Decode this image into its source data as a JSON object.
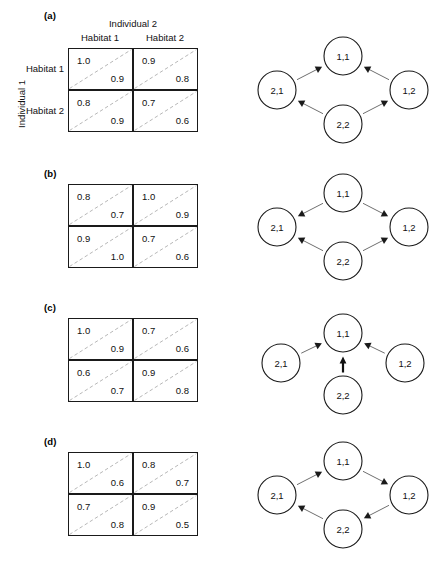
{
  "figure": {
    "axis_top_title": "Individual 2",
    "axis_left_title": "Individual 1",
    "col_headers": [
      "Habitat 1",
      "Habitat 2"
    ],
    "row_headers": [
      "Habitat 1",
      "Habitat 2"
    ],
    "node_labels": [
      "1,1",
      "1,2",
      "2,1",
      "2,2"
    ],
    "colors": {
      "ink": "#111111",
      "diagonal": "#b8b8b8",
      "border": "#1a1a1a",
      "arrow": "#6f6f6f",
      "arrow_bold": "#111111",
      "node_fill": "#ffffff"
    }
  },
  "panels": [
    {
      "letter": "(a)",
      "show_axis_labels": true,
      "matrix": {
        "cells": [
          [
            {
              "upper": "1.0",
              "lower": "0.9"
            },
            {
              "upper": "0.9",
              "lower": "0.8"
            }
          ],
          [
            {
              "upper": "0.8",
              "lower": "0.9"
            },
            {
              "upper": "0.7",
              "lower": "0.6"
            }
          ]
        ]
      },
      "graph": {
        "layout": "diamond",
        "edges": [
          {
            "from": "2,1",
            "to": "1,1",
            "bold": false
          },
          {
            "from": "1,2",
            "to": "1,1",
            "bold": false
          },
          {
            "from": "2,2",
            "to": "2,1",
            "bold": false
          },
          {
            "from": "2,2",
            "to": "1,2",
            "bold": false
          }
        ]
      }
    },
    {
      "letter": "(b)",
      "show_axis_labels": false,
      "matrix": {
        "cells": [
          [
            {
              "upper": "0.8",
              "lower": "0.7"
            },
            {
              "upper": "1.0",
              "lower": "0.9"
            }
          ],
          [
            {
              "upper": "0.9",
              "lower": "1.0"
            },
            {
              "upper": "0.7",
              "lower": "0.6"
            }
          ]
        ]
      },
      "graph": {
        "layout": "diamond",
        "edges": [
          {
            "from": "1,1",
            "to": "2,1",
            "bold": false
          },
          {
            "from": "1,1",
            "to": "1,2",
            "bold": false
          },
          {
            "from": "2,2",
            "to": "2,1",
            "bold": false
          },
          {
            "from": "2,2",
            "to": "1,2",
            "bold": false
          }
        ]
      }
    },
    {
      "letter": "(c)",
      "show_axis_labels": false,
      "matrix": {
        "cells": [
          [
            {
              "upper": "1.0",
              "lower": "0.9"
            },
            {
              "upper": "0.7",
              "lower": "0.6"
            }
          ],
          [
            {
              "upper": "0.6",
              "lower": "0.7"
            },
            {
              "upper": "0.9",
              "lower": "0.8"
            }
          ]
        ]
      },
      "graph": {
        "layout": "star",
        "edges": [
          {
            "from": "2,1",
            "to": "1,1",
            "bold": false
          },
          {
            "from": "1,2",
            "to": "1,1",
            "bold": false
          },
          {
            "from": "2,2",
            "to": "1,1",
            "bold": true
          }
        ]
      }
    },
    {
      "letter": "(d)",
      "show_axis_labels": false,
      "matrix": {
        "cells": [
          [
            {
              "upper": "1.0",
              "lower": "0.6"
            },
            {
              "upper": "0.8",
              "lower": "0.7"
            }
          ],
          [
            {
              "upper": "0.7",
              "lower": "0.8"
            },
            {
              "upper": "0.9",
              "lower": "0.5"
            }
          ]
        ]
      },
      "graph": {
        "layout": "diamond",
        "edges": [
          {
            "from": "2,1",
            "to": "1,1",
            "bold": false
          },
          {
            "from": "1,1",
            "to": "1,2",
            "bold": false
          },
          {
            "from": "1,2",
            "to": "2,2",
            "bold": false
          },
          {
            "from": "2,2",
            "to": "2,1",
            "bold": false
          }
        ]
      }
    }
  ]
}
